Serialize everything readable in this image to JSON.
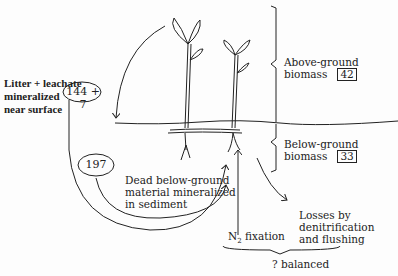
{
  "diagram": {
    "above_ground": {
      "label_line1": "Above-ground",
      "label_line2": "biomass",
      "value": "42"
    },
    "below_ground": {
      "label_line1": "Below-ground",
      "label_line2": "biomass",
      "value": "33"
    },
    "litter": {
      "line1": "Litter + leachate",
      "line2": "mineralized",
      "line3": "near surface",
      "value": "144 + 7"
    },
    "dead_below": {
      "value": "197",
      "line1": "Dead below-ground",
      "line2": "material mineralized",
      "line3": "in sediment"
    },
    "n2_fixation": {
      "prefix": "N",
      "sub": "2",
      "suffix": " fixation"
    },
    "losses": {
      "line1": "Losses by",
      "line2": "denitrification",
      "line3": "and flushing"
    },
    "balance_note": "? balanced"
  }
}
